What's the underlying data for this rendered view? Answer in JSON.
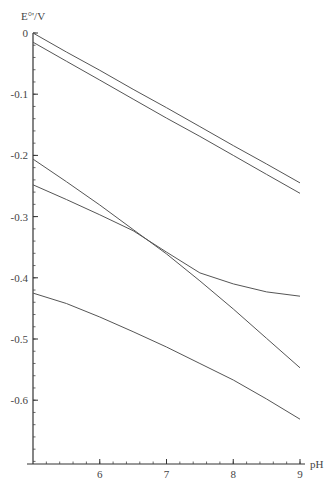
{
  "chart_data": {
    "type": "line",
    "title": "",
    "xlabel": "pH",
    "ylabel": "E°'/V",
    "xlim": [
      5,
      9
    ],
    "ylim": [
      -0.7,
      0
    ],
    "grid": false,
    "legend": null,
    "x_ticks": [
      6,
      7,
      8,
      9
    ],
    "x_tick_labels": [
      "6",
      "7",
      "8",
      "9"
    ],
    "y_ticks": [
      0,
      -0.1,
      -0.2,
      -0.3,
      -0.4,
      -0.5,
      -0.6
    ],
    "y_tick_labels": [
      "0",
      "-0.1",
      "-0.2",
      "-0.3",
      "-0.4",
      "-0.5",
      "-0.6"
    ],
    "x": [
      5,
      5.5,
      6,
      6.5,
      7,
      7.5,
      8,
      8.5,
      9
    ],
    "series": [
      {
        "name": "curve-1",
        "values": [
          0.0,
          -0.031,
          -0.061,
          -0.092,
          -0.122,
          -0.153,
          -0.184,
          -0.214,
          -0.245
        ]
      },
      {
        "name": "curve-2",
        "values": [
          -0.015,
          -0.046,
          -0.077,
          -0.108,
          -0.139,
          -0.169,
          -0.2,
          -0.231,
          -0.262
        ]
      },
      {
        "name": "curve-3",
        "values": [
          -0.206,
          -0.243,
          -0.281,
          -0.321,
          -0.361,
          -0.405,
          -0.451,
          -0.499,
          -0.547
        ]
      },
      {
        "name": "curve-4",
        "values": [
          -0.248,
          -0.272,
          -0.297,
          -0.323,
          -0.358,
          -0.392,
          -0.41,
          -0.423,
          -0.43
        ]
      },
      {
        "name": "curve-5",
        "values": [
          -0.425,
          -0.442,
          -0.464,
          -0.488,
          -0.513,
          -0.54,
          -0.567,
          -0.598,
          -0.631
        ]
      }
    ]
  }
}
